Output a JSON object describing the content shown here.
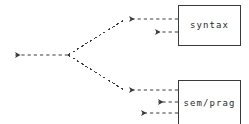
{
  "diagram": {
    "type": "dataflow-arrow-diagram",
    "canvas": {
      "width": 249,
      "height": 124,
      "background": "#ffffff"
    },
    "stroke_color": "#3a3a3a",
    "line_style": "dashed",
    "nodes": [
      {
        "id": "syntax",
        "label": "syntax",
        "shape": "rectangle",
        "x": 178,
        "y": 5,
        "width": 63,
        "height": 41
      },
      {
        "id": "sem_prag",
        "label": "sem/prag",
        "shape": "rectangle",
        "x": 178,
        "y": 80,
        "width": 63,
        "height": 46
      }
    ],
    "edges": [
      {
        "id": "output-arrow",
        "from": "fork",
        "to": "left-output",
        "style": "dashed",
        "arrowhead": "left",
        "x1": 68,
        "y1": 55,
        "x2": 9,
        "y2": 55
      },
      {
        "id": "fork-upper-branch",
        "from": "fork",
        "to": "syntax-arrow-1",
        "style": "dashed",
        "arrowhead": "none",
        "x1": 68,
        "y1": 55,
        "x2": 124,
        "y2": 20
      },
      {
        "id": "fork-lower-branch",
        "from": "fork",
        "to": "semprag-arrow-1",
        "style": "dashed",
        "arrowhead": "none",
        "x1": 68,
        "y1": 55,
        "x2": 124,
        "y2": 90
      },
      {
        "id": "syntax-arrow-1",
        "from": "syntax",
        "to": "fork-upper-branch",
        "style": "dashed",
        "arrowhead": "left",
        "x1": 178,
        "y1": 19,
        "x2": 123,
        "y2": 19
      },
      {
        "id": "syntax-arrow-2",
        "from": "syntax",
        "to": "open",
        "style": "dashed",
        "arrowhead": "left",
        "x1": 178,
        "y1": 32,
        "x2": 149,
        "y2": 32
      },
      {
        "id": "semprag-arrow-1",
        "from": "sem_prag",
        "to": "fork-lower-branch",
        "style": "dashed",
        "arrowhead": "left",
        "x1": 178,
        "y1": 90,
        "x2": 123,
        "y2": 90
      },
      {
        "id": "semprag-arrow-2",
        "from": "sem_prag",
        "to": "open",
        "style": "dashed",
        "arrowhead": "left",
        "x1": 178,
        "y1": 102,
        "x2": 152,
        "y2": 102
      },
      {
        "id": "semprag-arrow-3",
        "from": "sem_prag",
        "to": "open",
        "style": "dashed",
        "arrowhead": "left",
        "x1": 178,
        "y1": 113,
        "x2": 135,
        "y2": 113
      }
    ]
  }
}
